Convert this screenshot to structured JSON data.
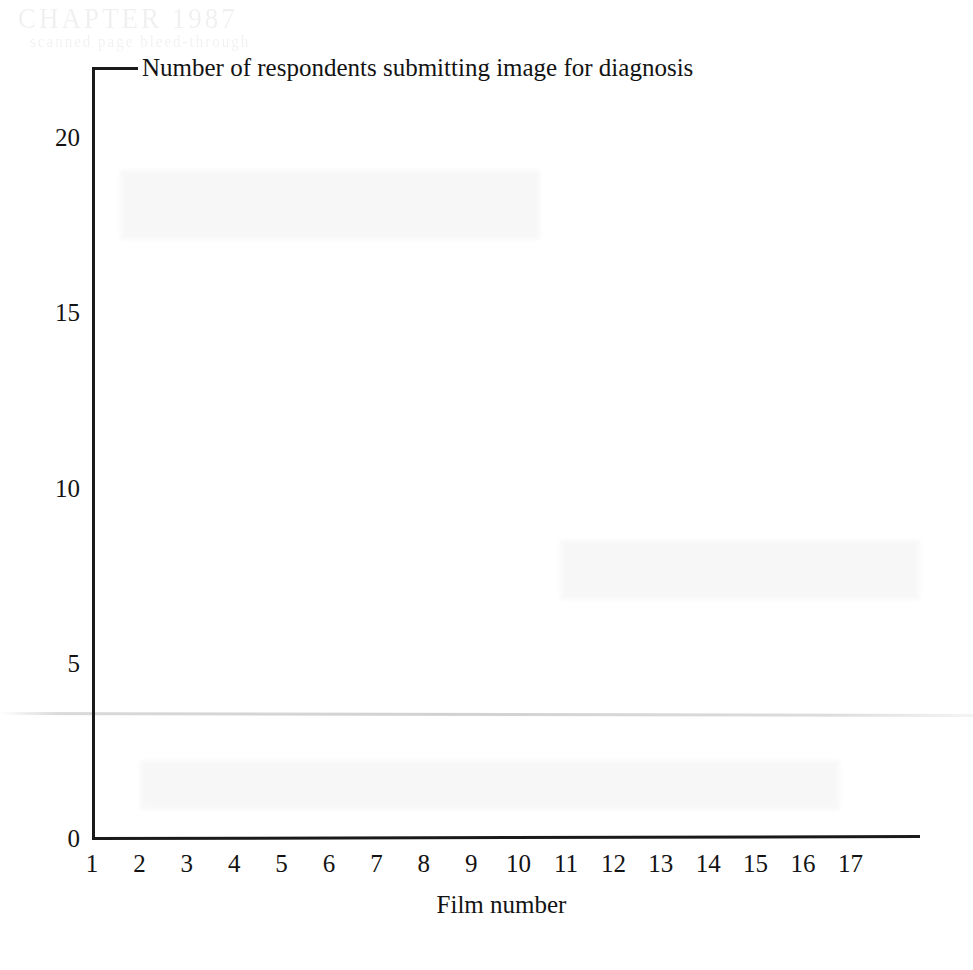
{
  "figure": {
    "background_color": "#ffffff",
    "ink_color": "#161616",
    "artifact_text_top": "CHAPTER 1987",
    "artifact_text_second": "scanned page bleed-through"
  },
  "chart_data": {
    "type": "bar",
    "title": "Number of respondents submitting image for diagnosis",
    "xlabel": "Film number",
    "ylabel": "",
    "categories": [
      "1",
      "2",
      "3",
      "4",
      "5",
      "6",
      "7",
      "8",
      "9",
      "10",
      "11",
      "12",
      "13",
      "14",
      "15",
      "16",
      "17"
    ],
    "values": [
      0,
      0,
      0,
      0,
      0,
      0,
      0,
      0,
      0,
      0,
      0,
      0,
      0,
      0,
      0,
      0,
      0
    ],
    "ytick_labels": [
      "0",
      "5",
      "10",
      "15",
      "20"
    ],
    "ytick_values": [
      0,
      5,
      10,
      15,
      20
    ],
    "ylim": [
      0,
      22
    ],
    "xlim": [
      0.5,
      17.5
    ],
    "grid": false,
    "legend": false,
    "legend_position": "none"
  },
  "axes": {
    "y_axis_name": "vertical-axis-line",
    "x_axis_name": "horizontal-axis-line",
    "leader_name": "title-leader-line"
  }
}
